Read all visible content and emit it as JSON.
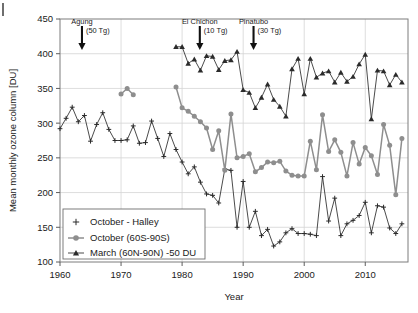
{
  "figure": {
    "corner_mark": "|"
  },
  "chart_data": {
    "type": "line",
    "title": "",
    "xlabel": "Year",
    "ylabel": "Mean monthly ozone column [DU]",
    "xlim": [
      1960,
      2017
    ],
    "ylim": [
      100,
      450
    ],
    "xticks": [
      1960,
      1970,
      1980,
      1990,
      2000,
      2010
    ],
    "yticks": [
      100,
      150,
      200,
      250,
      300,
      350,
      400,
      450
    ],
    "xtick_labels": [
      "1960",
      "1970",
      "1980",
      "1990",
      "2000",
      "2010"
    ],
    "ytick_labels": [
      "100",
      "150",
      "200",
      "250",
      "300",
      "350",
      "400",
      "450"
    ],
    "grid": true,
    "legend_position": "lower-left",
    "series": [
      {
        "name": "October - Halley",
        "marker": "plus",
        "color": "#2b2b2b",
        "x": [
          1960,
          1961,
          1962,
          1963,
          1964,
          1965,
          1966,
          1967,
          1968,
          1969,
          1970,
          1971,
          1972,
          1973,
          1974,
          1975,
          1976,
          1977,
          1978,
          1979,
          1980,
          1981,
          1982,
          1983,
          1984,
          1985,
          1986,
          1987,
          1988,
          1989,
          1990,
          1991,
          1992,
          1993,
          1994,
          1995,
          1996,
          1997,
          1998,
          1999,
          2000,
          2001,
          2002,
          2003,
          2004,
          2005,
          2006,
          2007,
          2008,
          2009,
          2010,
          2011,
          2012,
          2013,
          2014,
          2015,
          2016
        ],
        "y": [
          292,
          307,
          323,
          302,
          311,
          274,
          298,
          315,
          291,
          275,
          275,
          276,
          296,
          271,
          272,
          303,
          278,
          252,
          285,
          262,
          244,
          227,
          237,
          215,
          198,
          196,
          185,
          234,
          232,
          150,
          216,
          150,
          173,
          138,
          147,
          123,
          129,
          142,
          148,
          141,
          141,
          140,
          138,
          223,
          159,
          192,
          138,
          155,
          160,
          167,
          186,
          142,
          181,
          179,
          149,
          141,
          155
        ]
      },
      {
        "name": "October (60S-90S)",
        "marker": "circle",
        "color": "#8e8e8e",
        "segments": [
          {
            "x": [
              1970,
              1971,
              1972
            ],
            "y": [
              342,
              350,
              341
            ]
          },
          {
            "x": [
              1979,
              1980,
              1981,
              1982,
              1983,
              1984,
              1985,
              1986,
              1987,
              1988,
              1989,
              1990,
              1991,
              1992,
              1993,
              1994,
              1995,
              1996,
              1997,
              1998,
              1999,
              2000,
              2001,
              2002,
              2003,
              2004,
              2005,
              2006,
              2007,
              2008,
              2009,
              2010,
              2011,
              2012,
              2013,
              2014,
              2015,
              2016
            ],
            "y": [
              352,
              322,
              317,
              310,
              302,
              293,
              262,
              289,
              232,
              313,
              250,
              252,
              256,
              230,
              236,
              244,
              243,
              245,
              231,
              225,
              224,
              224,
              274,
              233,
              312,
              259,
              276,
              258,
              224,
              272,
              241,
              265,
              253,
              226,
              298,
              268,
              197,
              278
            ]
          }
        ]
      },
      {
        "name": "March (60N-90N) -50 DU",
        "marker": "triangle",
        "color": "#2b2b2b",
        "x": [
          1979,
          1980,
          1981,
          1982,
          1983,
          1984,
          1985,
          1986,
          1987,
          1988,
          1989,
          1990,
          1991,
          1992,
          1993,
          1994,
          1995,
          1996,
          1997,
          1998,
          1999,
          2000,
          2001,
          2002,
          2003,
          2004,
          2005,
          2006,
          2007,
          2008,
          2009,
          2010,
          2011,
          2012,
          2013,
          2014,
          2015,
          2016
        ],
        "y": [
          410,
          410,
          386,
          392,
          376,
          397,
          396,
          377,
          390,
          391,
          403,
          348,
          344,
          322,
          337,
          356,
          334,
          324,
          310,
          378,
          393,
          342,
          393,
          366,
          372,
          375,
          359,
          373,
          360,
          367,
          385,
          399,
          306,
          376,
          375,
          355,
          370,
          359
        ]
      }
    ],
    "annotations": [
      {
        "name": "Agung",
        "mass": "(50 Tg)",
        "year": 1963.6
      },
      {
        "name": "El Chichon",
        "mass": "(10 Tg)",
        "year": 1982.9
      },
      {
        "name": "Pinatubo",
        "mass": "(30 Tg)",
        "year": 1991.7
      }
    ]
  }
}
